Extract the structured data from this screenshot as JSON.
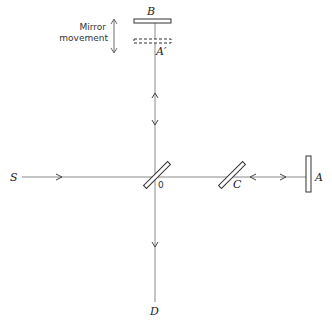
{
  "diagram": {
    "labels": {
      "source": "S",
      "mirror_movable": "B",
      "mirror_image": "A′",
      "mirror_fixed": "A",
      "compensator": "C",
      "beam_splitter": "0",
      "detector": "D",
      "movement_line1": "Mirror",
      "movement_line2": "movement"
    },
    "colors": {
      "line": "#8a8a8a",
      "stroke": "#333333",
      "background": "#ffffff"
    }
  }
}
